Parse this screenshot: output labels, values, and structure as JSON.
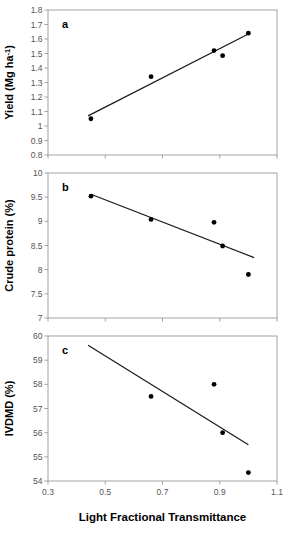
{
  "figure": {
    "title": "",
    "xlabel": "Light Fractional Transmittance",
    "panels": [
      "a",
      "b",
      "c"
    ]
  },
  "chart_data": [
    {
      "type": "scatter",
      "panel": "a",
      "panel_label": "a",
      "title": "",
      "xlabel": "Light Fractional Transmittance",
      "ylabel": "Yield (Mg ha-1)",
      "ylabel_parts": {
        "main": "Yield (Mg ha",
        "sup": "-1",
        "tail": ")"
      },
      "xlim": [
        0.3,
        1.1
      ],
      "ylim": [
        0.8,
        1.8
      ],
      "xticks": [
        0.3,
        0.5,
        0.7,
        0.9,
        1.1
      ],
      "xticklabels": [
        "0.3",
        "0.5",
        "0.7",
        "0.9",
        "1.1"
      ],
      "yticks": [
        0.8,
        0.9,
        1.0,
        1.1,
        1.2,
        1.3,
        1.4,
        1.5,
        1.6,
        1.7,
        1.8
      ],
      "yticklabels": [
        "0.8",
        "0.9",
        "1",
        "1.1",
        "1.2",
        "1.3",
        "1.4",
        "1.5",
        "1.6",
        "1.7",
        "1.8"
      ],
      "grid": false,
      "legend": null,
      "x": [
        0.45,
        0.66,
        0.88,
        0.91,
        1.0
      ],
      "values": [
        1.05,
        1.34,
        1.52,
        1.485,
        1.64
      ],
      "points": [
        {
          "x": 0.45,
          "y": 1.05
        },
        {
          "x": 0.66,
          "y": 1.34
        },
        {
          "x": 0.88,
          "y": 1.52
        },
        {
          "x": 0.91,
          "y": 1.485
        },
        {
          "x": 1.0,
          "y": 1.64
        }
      ],
      "fit_line": {
        "x0": 0.44,
        "y0": 1.07,
        "x1": 1.0,
        "y1": 1.635
      }
    },
    {
      "type": "scatter",
      "panel": "b",
      "panel_label": "b",
      "title": "",
      "xlabel": "Light Fractional Transmittance",
      "ylabel": "Crude protein (%)",
      "xlim": [
        0.3,
        1.1
      ],
      "ylim": [
        7,
        10
      ],
      "xticks": [
        0.3,
        0.5,
        0.7,
        0.9,
        1.1
      ],
      "xticklabels": [
        "0.3",
        "0.5",
        "0.7",
        "0.9",
        "1.1"
      ],
      "yticks": [
        7,
        7.5,
        8,
        8.5,
        9,
        9.5,
        10
      ],
      "yticklabels": [
        "7",
        "7.5",
        "8",
        "8.5",
        "9",
        "9.5",
        "10"
      ],
      "grid": false,
      "legend": null,
      "x": [
        0.45,
        0.66,
        0.88,
        0.91,
        1.0
      ],
      "values": [
        9.52,
        9.04,
        8.98,
        8.49,
        7.9
      ],
      "points": [
        {
          "x": 0.45,
          "y": 9.52
        },
        {
          "x": 0.66,
          "y": 9.04
        },
        {
          "x": 0.88,
          "y": 8.98
        },
        {
          "x": 0.91,
          "y": 8.49
        },
        {
          "x": 1.0,
          "y": 7.9
        }
      ],
      "fit_line": {
        "x0": 0.45,
        "y0": 9.56,
        "x1": 1.02,
        "y1": 8.25
      }
    },
    {
      "type": "scatter",
      "panel": "c",
      "panel_label": "c",
      "title": "",
      "xlabel": "Light Fractional Transmittance",
      "ylabel": "IVDMD (%)",
      "xlim": [
        0.3,
        1.1
      ],
      "ylim": [
        54,
        60
      ],
      "xticks": [
        0.3,
        0.5,
        0.7,
        0.9,
        1.1
      ],
      "xticklabels": [
        "0.3",
        "0.5",
        "0.7",
        "0.9",
        "1.1"
      ],
      "yticks": [
        54,
        55,
        56,
        57,
        58,
        59,
        60
      ],
      "yticklabels": [
        "54",
        "55",
        "56",
        "57",
        "58",
        "59",
        "60"
      ],
      "grid": false,
      "legend": null,
      "x": [
        0.66,
        0.88,
        0.91,
        1.0
      ],
      "values": [
        57.5,
        58.0,
        56.0,
        54.35
      ],
      "points": [
        {
          "x": 0.66,
          "y": 57.5
        },
        {
          "x": 0.88,
          "y": 58.0
        },
        {
          "x": 0.91,
          "y": 56.0
        },
        {
          "x": 1.0,
          "y": 54.35
        }
      ],
      "fit_line": {
        "x0": 0.44,
        "y0": 59.62,
        "x1": 1.0,
        "y1": 55.5
      }
    }
  ]
}
